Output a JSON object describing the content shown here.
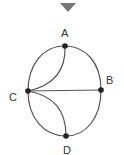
{
  "diagram": {
    "type": "graph",
    "marker": {
      "shape": "triangle-down",
      "color": "#777777"
    },
    "colors": {
      "edge": "#555555",
      "node": "#222222",
      "label": "#333333"
    },
    "nodes": [
      {
        "id": "A",
        "label": "A"
      },
      {
        "id": "B",
        "label": "B"
      },
      {
        "id": "C",
        "label": "C"
      },
      {
        "id": "D",
        "label": "D"
      }
    ],
    "edges": [
      {
        "from": "A",
        "to": "B",
        "style": "outer-arc"
      },
      {
        "from": "A",
        "to": "C",
        "style": "outer-arc"
      },
      {
        "from": "A",
        "to": "C",
        "style": "inner-curve"
      },
      {
        "from": "C",
        "to": "B",
        "style": "straight"
      },
      {
        "from": "C",
        "to": "D",
        "style": "outer-arc"
      },
      {
        "from": "C",
        "to": "D",
        "style": "inner-curve"
      },
      {
        "from": "B",
        "to": "D",
        "style": "outer-arc"
      }
    ]
  }
}
